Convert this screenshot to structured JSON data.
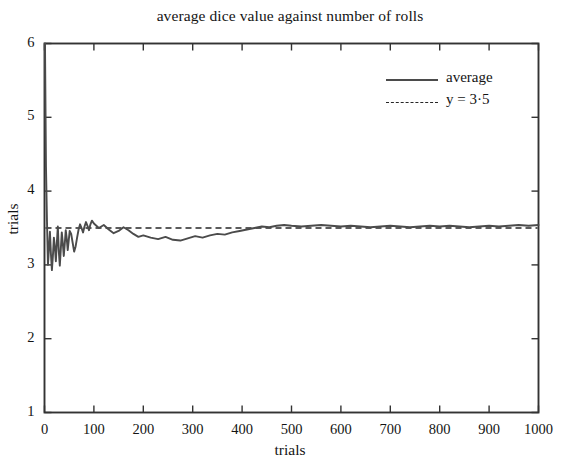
{
  "chart_data": {
    "type": "line",
    "title": "average dice value against number of rolls",
    "xlabel": "trials",
    "ylabel": "trials",
    "xlim": [
      0,
      1000
    ],
    "ylim": [
      1,
      6
    ],
    "grid": false,
    "legend_position": "top-right",
    "xticks": [
      0,
      100,
      200,
      300,
      400,
      500,
      600,
      700,
      800,
      900,
      1000
    ],
    "xtick_labels": [
      "0",
      "100",
      "200",
      "300",
      "400",
      "500",
      "600",
      "700",
      "800",
      "900",
      "1000"
    ],
    "yticks": [
      1,
      2,
      3,
      4,
      5,
      6
    ],
    "ytick_labels": [
      "1",
      "2",
      "3",
      "4",
      "5",
      "6"
    ],
    "series": [
      {
        "name": "average",
        "style": "solid",
        "color": "#4b4b4b",
        "x": [
          1,
          3,
          5,
          7,
          9,
          11,
          13,
          15,
          17,
          19,
          21,
          23,
          25,
          27,
          29,
          31,
          33,
          35,
          37,
          39,
          41,
          43,
          45,
          47,
          49,
          51,
          54,
          57,
          60,
          63,
          66,
          69,
          72,
          75,
          78,
          81,
          84,
          87,
          90,
          93,
          96,
          100,
          110,
          120,
          130,
          140,
          150,
          160,
          170,
          180,
          190,
          200,
          215,
          230,
          245,
          260,
          275,
          290,
          305,
          320,
          335,
          350,
          365,
          380,
          395,
          410,
          425,
          440,
          455,
          470,
          485,
          500,
          520,
          540,
          560,
          580,
          600,
          620,
          640,
          660,
          680,
          700,
          720,
          740,
          760,
          780,
          800,
          820,
          840,
          860,
          880,
          900,
          920,
          940,
          960,
          980,
          1000
        ],
        "y": [
          6.0,
          4.33,
          3.6,
          3.0,
          3.22,
          3.45,
          3.15,
          2.93,
          3.12,
          3.37,
          3.24,
          3.05,
          3.3,
          3.52,
          3.18,
          2.99,
          3.21,
          3.44,
          3.3,
          3.12,
          3.28,
          3.47,
          3.36,
          3.2,
          3.33,
          3.46,
          3.42,
          3.3,
          3.18,
          3.25,
          3.37,
          3.48,
          3.55,
          3.5,
          3.44,
          3.52,
          3.58,
          3.53,
          3.47,
          3.55,
          3.6,
          3.56,
          3.5,
          3.54,
          3.48,
          3.43,
          3.46,
          3.51,
          3.47,
          3.42,
          3.38,
          3.4,
          3.37,
          3.35,
          3.38,
          3.34,
          3.33,
          3.36,
          3.39,
          3.37,
          3.4,
          3.42,
          3.41,
          3.44,
          3.46,
          3.48,
          3.5,
          3.52,
          3.51,
          3.53,
          3.54,
          3.53,
          3.52,
          3.53,
          3.54,
          3.53,
          3.52,
          3.53,
          3.52,
          3.51,
          3.52,
          3.53,
          3.52,
          3.51,
          3.52,
          3.53,
          3.52,
          3.53,
          3.52,
          3.51,
          3.52,
          3.53,
          3.52,
          3.53,
          3.54,
          3.53,
          3.54
        ]
      },
      {
        "name": "y = 3·5",
        "style": "dashed",
        "color": "#262626",
        "constant_y": 3.5
      }
    ],
    "legend": [
      {
        "label": "average",
        "style": "solid"
      },
      {
        "label": "y = 3·5",
        "style": "dashed"
      }
    ]
  },
  "axes": {
    "frame_color": "#333333"
  }
}
